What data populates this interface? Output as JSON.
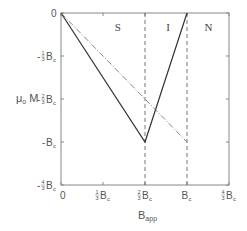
{
  "chart_data": {
    "type": "line",
    "title": "",
    "xlabel": "B",
    "xlabel_sub": "app",
    "ylabel": "μ",
    "ylabel_sub": "o",
    "ylabel_tail": " M",
    "x_ticks": [
      {
        "value": 0,
        "num": "",
        "den": "",
        "tail": "0"
      },
      {
        "value": 0.3333,
        "num": "1",
        "den": "3",
        "tail": "B",
        "sub": "c"
      },
      {
        "value": 0.6667,
        "num": "2",
        "den": "3",
        "tail": "B",
        "sub": "c"
      },
      {
        "value": 1.0,
        "num": "",
        "den": "",
        "tail": "B",
        "sub": "c"
      },
      {
        "value": 1.3333,
        "num": "4",
        "den": "3",
        "tail": "B",
        "sub": "c"
      }
    ],
    "y_ticks": [
      {
        "value": 0,
        "prefix": "",
        "num": "",
        "den": "",
        "tail": "0"
      },
      {
        "value": -0.3333,
        "prefix": "-",
        "num": "1",
        "den": "3",
        "tail": "B",
        "sub": "c"
      },
      {
        "value": -0.6667,
        "prefix": "-",
        "num": "2",
        "den": "3",
        "tail": "B",
        "sub": "c"
      },
      {
        "value": -1.0,
        "prefix": "-",
        "num": "",
        "den": "",
        "tail": "B",
        "sub": "c"
      },
      {
        "value": -1.3333,
        "prefix": "-",
        "num": "4",
        "den": "3",
        "tail": "B",
        "sub": "c"
      }
    ],
    "xlim": [
      0,
      1.3333
    ],
    "ylim": [
      -1.3333,
      0
    ],
    "grid": false,
    "series": [
      {
        "name": "solid",
        "style": "solid",
        "x": [
          0,
          0.6667,
          1.0
        ],
        "y": [
          0,
          -1.0,
          0
        ]
      },
      {
        "name": "dash-dot",
        "style": "dashdot",
        "x": [
          0,
          1.0
        ],
        "y": [
          0,
          -1.0
        ]
      }
    ],
    "vlines": [
      {
        "x": 0.6667,
        "style": "dashed"
      },
      {
        "x": 1.0,
        "style": "dashed"
      }
    ],
    "annotations": [
      {
        "text": "S",
        "x": 0.45,
        "y": -0.14
      },
      {
        "text": "I",
        "x": 0.85,
        "y": -0.14
      },
      {
        "text": "N",
        "x": 1.17,
        "y": -0.14
      }
    ]
  }
}
